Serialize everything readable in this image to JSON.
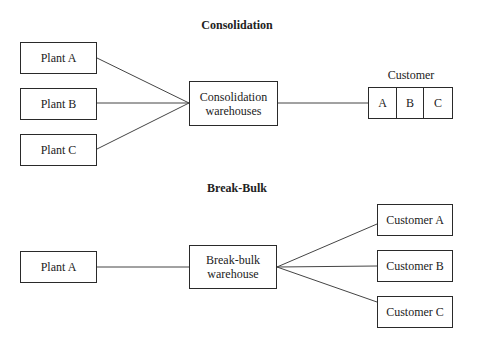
{
  "consolidation": {
    "title": "Consolidation",
    "plants": [
      "Plant A",
      "Plant B",
      "Plant C"
    ],
    "warehouse": "Consolidation warehouses",
    "warehouse_line1": "Consolidation",
    "warehouse_line2": "warehouses",
    "customer_label": "Customer",
    "customer_cells": [
      "A",
      "B",
      "C"
    ]
  },
  "break_bulk": {
    "title": "Break-Bulk",
    "plant": "Plant A",
    "warehouse_line1": "Break-bulk",
    "warehouse_line2": "warehouse",
    "customers": [
      "Customer A",
      "Customer B",
      "Customer C"
    ]
  }
}
